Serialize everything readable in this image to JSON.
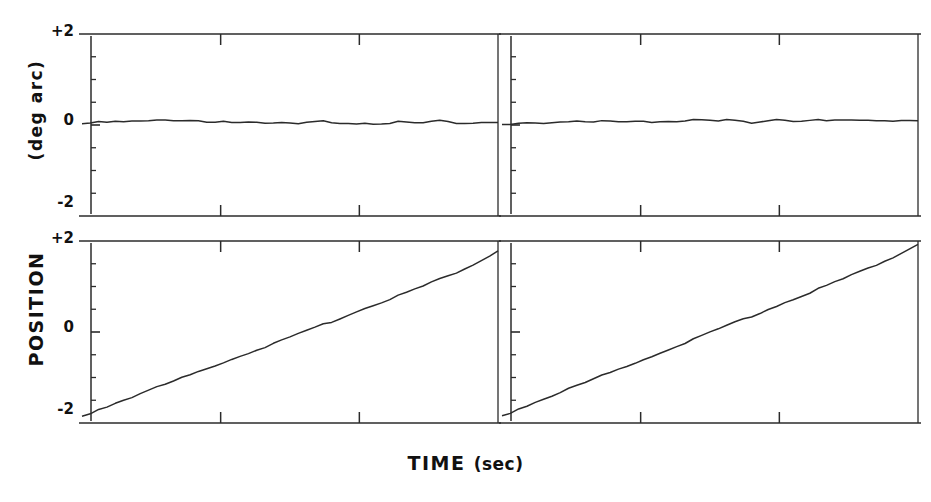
{
  "figure": {
    "background": "#ffffff",
    "ink_color": "#2b2b2b",
    "axis_label_color": "#111111"
  },
  "axes": {
    "ylabel_top": "(deg arc)",
    "ylabel_bottom": "POSITION",
    "xlabel_main": "TIME",
    "xlabel_unit": "(sec)",
    "ytick_plus2": "+2",
    "ytick_zero": "0",
    "ytick_minus2": "-2"
  },
  "chart_data": {
    "type": "line",
    "title": "",
    "xlabel": "TIME (sec)",
    "ylabel": "POSITION (deg arc)",
    "ylim": [
      -2,
      2
    ],
    "xlim": [
      0,
      1
    ],
    "grid": false,
    "legend": null,
    "yticks": [
      2,
      0,
      -2
    ],
    "ytick_labels": [
      "+2",
      "0",
      "-2"
    ],
    "y_minor_tick_values": [
      1.5,
      1.0,
      0.5,
      0.0,
      -0.5,
      -1.0,
      -1.5
    ],
    "x_tick_fractions": [
      0.3333,
      0.6667
    ],
    "panel_layout": "2x2",
    "panels": [
      {
        "id": "top-left",
        "row": 0,
        "col": 0,
        "row_label": "(deg arc)",
        "description": "flat noisy trace held near zero",
        "series": [
          {
            "name": "position",
            "x": [
              0.0,
              0.02,
              0.04,
              0.06,
              0.08,
              0.1,
              0.12,
              0.14,
              0.16,
              0.18,
              0.2,
              0.22,
              0.24,
              0.26,
              0.28,
              0.3,
              0.32,
              0.34,
              0.36,
              0.38,
              0.4,
              0.42,
              0.44,
              0.46,
              0.48,
              0.5,
              0.52,
              0.54,
              0.56,
              0.58,
              0.6,
              0.62,
              0.64,
              0.66,
              0.68,
              0.7,
              0.72,
              0.74,
              0.76,
              0.78,
              0.8,
              0.82,
              0.84,
              0.86,
              0.88,
              0.9,
              0.92,
              0.94,
              0.96,
              0.98,
              1.0
            ],
            "y": [
              0.02,
              0.05,
              0.07,
              0.06,
              0.08,
              0.07,
              0.09,
              0.08,
              0.07,
              0.09,
              0.1,
              0.08,
              0.07,
              0.09,
              0.08,
              0.06,
              0.07,
              0.08,
              0.06,
              0.05,
              0.07,
              0.06,
              0.04,
              0.02,
              0.03,
              0.02,
              0.01,
              0.03,
              0.05,
              0.07,
              0.06,
              0.04,
              0.03,
              0.02,
              0.03,
              0.02,
              0.03,
              0.04,
              0.06,
              0.05,
              0.03,
              0.04,
              0.06,
              0.08,
              0.06,
              0.04,
              0.03,
              0.04,
              0.05,
              0.05,
              0.05
            ]
          }
        ]
      },
      {
        "id": "top-right",
        "row": 0,
        "col": 1,
        "row_label": "(deg arc)",
        "description": "flat noisy trace held near zero",
        "series": [
          {
            "name": "position",
            "x": [
              0.0,
              0.02,
              0.04,
              0.06,
              0.08,
              0.1,
              0.12,
              0.14,
              0.16,
              0.18,
              0.2,
              0.22,
              0.24,
              0.26,
              0.28,
              0.3,
              0.32,
              0.34,
              0.36,
              0.38,
              0.4,
              0.42,
              0.44,
              0.46,
              0.48,
              0.5,
              0.52,
              0.54,
              0.56,
              0.58,
              0.6,
              0.62,
              0.64,
              0.66,
              0.68,
              0.7,
              0.72,
              0.74,
              0.76,
              0.78,
              0.8,
              0.82,
              0.84,
              0.86,
              0.88,
              0.9,
              0.92,
              0.94,
              0.96,
              0.98,
              1.0
            ],
            "y": [
              0.0,
              0.02,
              0.03,
              0.05,
              0.04,
              0.03,
              0.05,
              0.06,
              0.05,
              0.07,
              0.06,
              0.05,
              0.07,
              0.08,
              0.06,
              0.07,
              0.09,
              0.08,
              0.06,
              0.07,
              0.08,
              0.07,
              0.09,
              0.1,
              0.09,
              0.08,
              0.07,
              0.09,
              0.08,
              0.06,
              0.05,
              0.07,
              0.09,
              0.12,
              0.1,
              0.08,
              0.09,
              0.11,
              0.1,
              0.08,
              0.09,
              0.1,
              0.09,
              0.08,
              0.09,
              0.1,
              0.09,
              0.08,
              0.09,
              0.09,
              0.09
            ]
          }
        ]
      },
      {
        "id": "bottom-left",
        "row": 1,
        "col": 0,
        "row_label": "POSITION",
        "description": "steady upward ramp from about -1.85 to +1.80",
        "series": [
          {
            "name": "position",
            "x": [
              0.0,
              0.02,
              0.04,
              0.06,
              0.08,
              0.1,
              0.12,
              0.14,
              0.16,
              0.18,
              0.2,
              0.22,
              0.24,
              0.26,
              0.28,
              0.3,
              0.32,
              0.34,
              0.36,
              0.38,
              0.4,
              0.42,
              0.44,
              0.46,
              0.48,
              0.5,
              0.52,
              0.54,
              0.56,
              0.58,
              0.6,
              0.62,
              0.64,
              0.66,
              0.68,
              0.7,
              0.72,
              0.74,
              0.76,
              0.78,
              0.8,
              0.82,
              0.84,
              0.86,
              0.88,
              0.9,
              0.92,
              0.94,
              0.96,
              0.98,
              1.0
            ],
            "y": [
              -1.86,
              -1.79,
              -1.71,
              -1.65,
              -1.57,
              -1.5,
              -1.44,
              -1.36,
              -1.3,
              -1.22,
              -1.16,
              -1.09,
              -1.02,
              -0.95,
              -0.88,
              -0.81,
              -0.74,
              -0.68,
              -0.6,
              -0.54,
              -0.47,
              -0.4,
              -0.34,
              -0.27,
              -0.2,
              -0.13,
              -0.05,
              0.01,
              0.08,
              0.16,
              0.22,
              0.29,
              0.36,
              0.44,
              0.51,
              0.58,
              0.65,
              0.72,
              0.79,
              0.86,
              0.93,
              1.0,
              1.08,
              1.15,
              1.22,
              1.3,
              1.38,
              1.47,
              1.56,
              1.66,
              1.78
            ]
          }
        ]
      },
      {
        "id": "bottom-right",
        "row": 1,
        "col": 1,
        "row_label": "POSITION",
        "description": "steady upward ramp from about -1.85 to +1.92",
        "series": [
          {
            "name": "position",
            "x": [
              0.0,
              0.02,
              0.04,
              0.06,
              0.08,
              0.1,
              0.12,
              0.14,
              0.16,
              0.18,
              0.2,
              0.22,
              0.24,
              0.26,
              0.28,
              0.3,
              0.32,
              0.34,
              0.36,
              0.38,
              0.4,
              0.42,
              0.44,
              0.46,
              0.48,
              0.5,
              0.52,
              0.54,
              0.56,
              0.58,
              0.6,
              0.62,
              0.64,
              0.66,
              0.68,
              0.7,
              0.72,
              0.74,
              0.76,
              0.78,
              0.8,
              0.82,
              0.84,
              0.86,
              0.88,
              0.9,
              0.92,
              0.94,
              0.96,
              0.98,
              1.0
            ],
            "y": [
              -1.85,
              -1.78,
              -1.7,
              -1.63,
              -1.55,
              -1.48,
              -1.41,
              -1.34,
              -1.26,
              -1.19,
              -1.12,
              -1.04,
              -0.97,
              -0.9,
              -0.83,
              -0.76,
              -0.68,
              -0.61,
              -0.54,
              -0.47,
              -0.39,
              -0.32,
              -0.25,
              -0.17,
              -0.1,
              -0.02,
              0.05,
              0.12,
              0.2,
              0.27,
              0.34,
              0.41,
              0.49,
              0.56,
              0.64,
              0.71,
              0.79,
              0.86,
              0.94,
              1.01,
              1.09,
              1.16,
              1.24,
              1.31,
              1.39,
              1.47,
              1.55,
              1.63,
              1.72,
              1.82,
              1.92
            ]
          }
        ]
      }
    ]
  }
}
